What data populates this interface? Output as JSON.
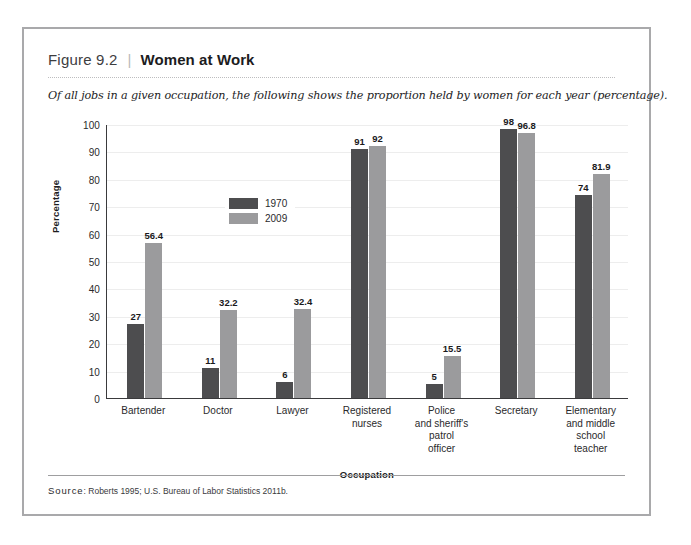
{
  "header": {
    "figure_number": "Figure 9.2",
    "separator": "|",
    "title": "Women at Work",
    "subtitle": "Of all jobs in a given occupation, the following shows the proportion held by women for each year (percentage)."
  },
  "source": {
    "label": "Source",
    "colon": ":",
    "text": "Roberts 1995; U.S. Bureau of Labor Statistics 2011b."
  },
  "colors": {
    "series_1970": "#4d4d4f",
    "series_2009": "#9b9b9d",
    "axis": "#3a3a3c",
    "gridline": "#ededed",
    "frame": "#a9a9ab"
  },
  "chart_data": {
    "type": "bar",
    "title": "Women at Work",
    "subtitle": "Of all jobs in a given occupation, the following shows the proportion held by women for each year (percentage).",
    "xlabel": "Occupation",
    "ylabel": "Percentage",
    "ylim": [
      0,
      100
    ],
    "yticks": [
      0,
      10,
      20,
      30,
      40,
      50,
      60,
      70,
      80,
      90,
      100
    ],
    "grid": true,
    "legend_position": "inside-upper-left",
    "categories": [
      "Bartender",
      "Doctor",
      "Lawyer",
      "Registered nurses",
      "Police and sheriff's patrol officer",
      "Secretary",
      "Elementary and middle school teacher"
    ],
    "category_lines": [
      [
        "Bartender"
      ],
      [
        "Doctor"
      ],
      [
        "Lawyer"
      ],
      [
        "Registered",
        "nurses"
      ],
      [
        "Police",
        "and sheriff's",
        "patrol",
        "officer"
      ],
      [
        "Secretary"
      ],
      [
        "Elementary",
        "and middle",
        "school",
        "teacher"
      ]
    ],
    "series": [
      {
        "name": "1970",
        "color": "#4d4d4f",
        "values": [
          27,
          11,
          6,
          91,
          5,
          98,
          74
        ],
        "labels": [
          "27",
          "11",
          "6",
          "91",
          "5",
          "98",
          "74"
        ]
      },
      {
        "name": "2009",
        "color": "#9b9b9d",
        "values": [
          56.4,
          32.2,
          32.4,
          92,
          15.5,
          96.8,
          81.9
        ],
        "labels": [
          "56.4",
          "32.2",
          "32.4",
          "92",
          "15.5",
          "96.8",
          "81.9"
        ]
      }
    ]
  }
}
